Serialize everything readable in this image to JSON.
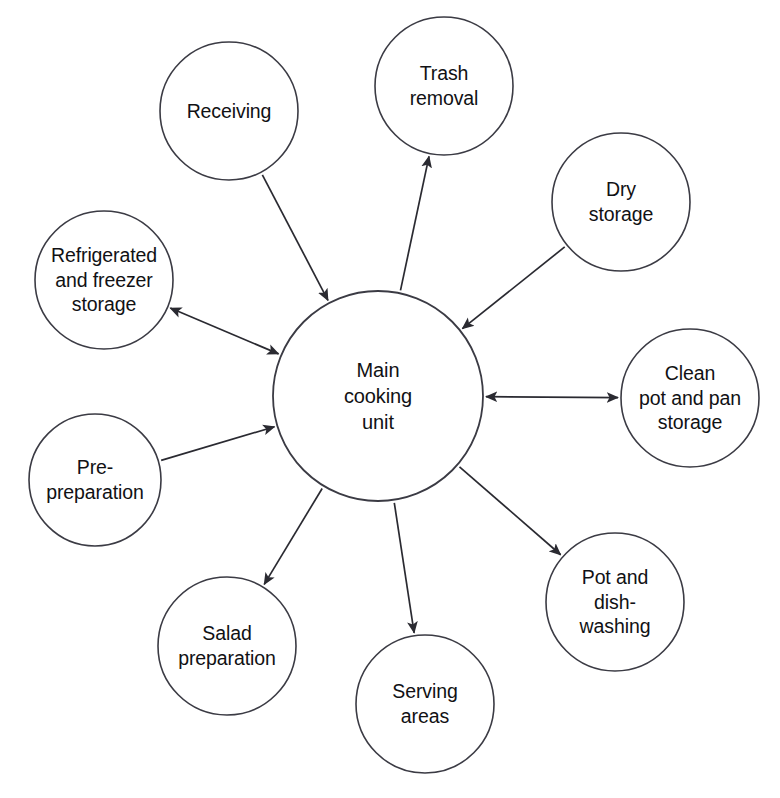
{
  "diagram": {
    "type": "hub-and-spoke",
    "background_color": "#ffffff",
    "line_color": "#2a2a31",
    "text_color": "#111114",
    "hub": {
      "id": "main-cooking-unit",
      "label": "Main\ncooking\nunit",
      "cx": 378,
      "cy": 396,
      "r": 105
    },
    "nodes": [
      {
        "id": "receiving",
        "label": "Receiving",
        "cx": 229,
        "cy": 111,
        "r": 69,
        "label_width": 150,
        "direction": "to-hub"
      },
      {
        "id": "trash-removal",
        "label": "Trash\nremoval",
        "cx": 444,
        "cy": 86,
        "r": 69,
        "label_width": 140,
        "direction": "from-hub"
      },
      {
        "id": "dry-storage",
        "label": "Dry\nstorage",
        "cx": 621,
        "cy": 202,
        "r": 69,
        "label_width": 140,
        "direction": "to-hub"
      },
      {
        "id": "clean-pot-and-pan-storage",
        "label": "Clean\npot and pan\nstorage",
        "cx": 690,
        "cy": 398,
        "r": 69,
        "label_width": 152,
        "direction": "both"
      },
      {
        "id": "pot-and-dish-washing",
        "label": "Pot and\ndish-\nwashing",
        "cx": 615,
        "cy": 602,
        "r": 69,
        "label_width": 140,
        "direction": "from-hub"
      },
      {
        "id": "serving-areas",
        "label": "Serving\nareas",
        "cx": 425,
        "cy": 704,
        "r": 69,
        "label_width": 140,
        "direction": "from-hub"
      },
      {
        "id": "salad-preparation",
        "label": "Salad\npreparation",
        "cx": 227,
        "cy": 646,
        "r": 69,
        "label_width": 160,
        "direction": "from-hub"
      },
      {
        "id": "pre-preparation",
        "label": "Pre-\npreparation",
        "cx": 95,
        "cy": 480,
        "r": 66,
        "label_width": 160,
        "direction": "to-hub"
      },
      {
        "id": "refrigerated-and-freezer-storage",
        "label": "Refrigerated\nand freezer\nstorage",
        "cx": 104,
        "cy": 280,
        "r": 69,
        "label_width": 166,
        "direction": "both"
      }
    ]
  }
}
